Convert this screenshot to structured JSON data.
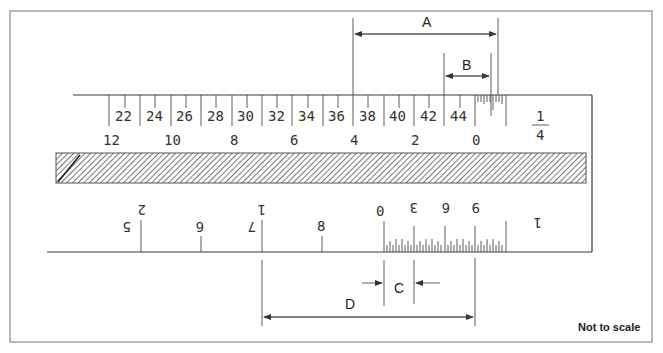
{
  "diagram": {
    "note": "Not to scale",
    "upper_scale": {
      "main_labels": [
        "22",
        "24",
        "26",
        "28",
        "30",
        "32",
        "34",
        "36",
        "38",
        "40",
        "42",
        "44"
      ],
      "vernier_labels": [
        "12",
        "10",
        "8",
        "6",
        "4",
        "2",
        "0"
      ],
      "fraction": {
        "numerator": "1",
        "denominator": "4"
      }
    },
    "lower_scale": {
      "main_labels_rotated": [
        "5",
        "6",
        "7",
        "8"
      ],
      "main_upper_rotated": [
        "2",
        "1"
      ],
      "vernier_labels_rotated": [
        "0",
        "3",
        "6",
        "9"
      ],
      "unit_glyph": "1"
    },
    "dimensions": {
      "A": "A",
      "B": "B",
      "C": "C",
      "D": "D"
    },
    "colors": {
      "line": "#3a3a3a",
      "frame": "#8a8a8a",
      "hatch": "#555555"
    }
  }
}
